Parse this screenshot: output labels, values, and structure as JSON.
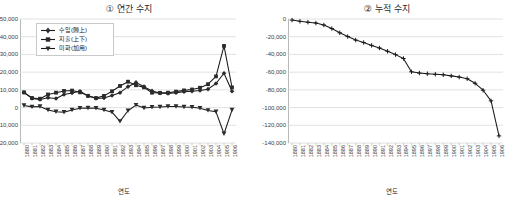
{
  "chart_data": [
    {
      "type": "line",
      "id": "annual-balance",
      "title": "① 연간 수지",
      "xlabel": "연도",
      "ylabel": "",
      "grid": true,
      "legend_position": "top-left",
      "ylim": [
        -20000,
        50000
      ],
      "yticks": [
        50000,
        40000,
        30000,
        20000,
        10000,
        0,
        -10000,
        -20000
      ],
      "ytick_labels": [
        "50,000",
        "40,000",
        "30,000",
        "20,000",
        "10,000",
        "0",
        "-10,000",
        "-20,000"
      ],
      "categories": [
        "1880",
        "1881",
        "1882",
        "1883",
        "1884",
        "1885",
        "1886",
        "1887",
        "1888",
        "1889",
        "1890",
        "1891",
        "1892",
        "1893",
        "1894",
        "1895",
        "1896",
        "1897",
        "1898",
        "1899",
        "1900",
        "1901",
        "1902",
        "1903",
        "1904",
        "1905",
        "1906"
      ],
      "series": [
        {
          "name": "수입(賻上)",
          "marker": "diamond",
          "values": [
            8500,
            5200,
            4600,
            5600,
            5100,
            7400,
            8200,
            9200,
            6600,
            5200,
            5400,
            6800,
            8400,
            11800,
            14200,
            11800,
            9400,
            8200,
            8000,
            8400,
            8900,
            9200,
            9600,
            10400,
            13600,
            19400,
            9200
          ]
        },
        {
          "name": "지출(上下)",
          "marker": "square",
          "values": [
            8600,
            5400,
            5000,
            7400,
            8400,
            9400,
            9600,
            8600,
            6600,
            5400,
            6600,
            9200,
            12200,
            14600,
            12600,
            11400,
            8400,
            8300,
            8400,
            9000,
            9700,
            10200,
            11200,
            13200,
            17600,
            34800,
            11400
          ]
        },
        {
          "name": "미화(加用)",
          "marker": "triangle",
          "values": [
            1200,
            400,
            600,
            -1400,
            -2400,
            -2600,
            -1400,
            -400,
            -200,
            -400,
            -1400,
            -2600,
            -7800,
            -1800,
            1400,
            -200,
            200,
            300,
            600,
            600,
            300,
            200,
            -400,
            -1600,
            -2400,
            -14800,
            -1400
          ]
        }
      ]
    },
    {
      "type": "line",
      "id": "cumulative-balance",
      "title": "② 누적 수지",
      "xlabel": "연도",
      "ylabel": "",
      "grid": true,
      "legend_position": "none",
      "ylim": [
        -140000,
        0
      ],
      "yticks": [
        0,
        -20000,
        -40000,
        -60000,
        -80000,
        -100000,
        -120000,
        -140000
      ],
      "ytick_labels": [
        "0",
        "-20,000",
        "-40,000",
        "-60,000",
        "-80,000",
        "-100,000",
        "-120,000",
        "-140,000"
      ],
      "categories": [
        "1880",
        "1881",
        "1882",
        "1883",
        "1884",
        "1885",
        "1886",
        "1887",
        "1888",
        "1889",
        "1890",
        "1891",
        "1892",
        "1893",
        "1894",
        "1895",
        "1896",
        "1897",
        "1898",
        "1899",
        "1900",
        "1901",
        "1902",
        "1903",
        "1904",
        "1905",
        "1906"
      ],
      "series": [
        {
          "name": "누적 수지",
          "marker": "plus",
          "values": [
            -1200,
            -2600,
            -3600,
            -4600,
            -6800,
            -10800,
            -15600,
            -19800,
            -23800,
            -26600,
            -29800,
            -32800,
            -36400,
            -40200,
            -44600,
            -59600,
            -61000,
            -61800,
            -62400,
            -63000,
            -64200,
            -65600,
            -67400,
            -72600,
            -80400,
            -92400,
            -132000
          ]
        }
      ]
    }
  ],
  "legend": {
    "items": [
      {
        "label": "수입(賻上)",
        "marker": "diamond"
      },
      {
        "label": "지출(上下)",
        "marker": "square"
      },
      {
        "label": "미화(加用)",
        "marker": "triangle"
      }
    ]
  },
  "colors": {
    "series_line": "#1a1a1a",
    "grid": "#d4d4d4",
    "axis": "#b9b9b9",
    "text": "#2a2a2a",
    "background": "#ffffff"
  }
}
